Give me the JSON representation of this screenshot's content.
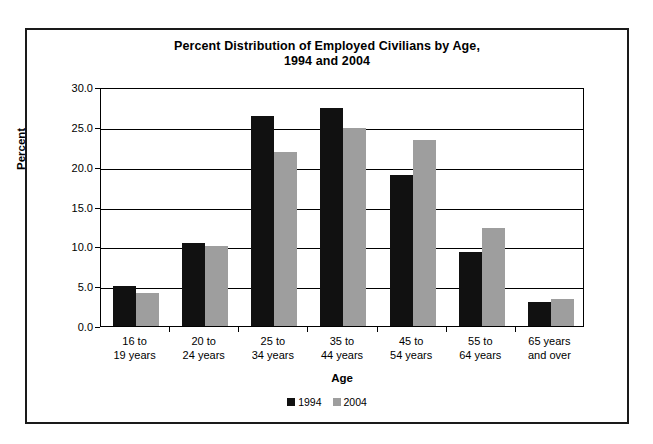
{
  "chart_data": {
    "type": "bar",
    "title": "Percent Distribution of Employed Civilians by Age,",
    "title_line2": "1994 and 2004",
    "xlabel": "Age",
    "ylabel": "Percent",
    "ylim": [
      0,
      30
    ],
    "ytick_labels": [
      "30.0",
      "25.0",
      "20.0",
      "15.0",
      "10.0",
      "5.0",
      "0.0"
    ],
    "ytick_values": [
      30,
      25,
      20,
      15,
      10,
      5,
      0
    ],
    "grid": true,
    "legend_position": "bottom",
    "categories": [
      "16 to\n19 years",
      "20 to\n24 years",
      "25 to\n34 years",
      "35 to\n44 years",
      "45 to\n54 years",
      "55 to\n64 years",
      "65 years\nand over"
    ],
    "categories_lines": [
      [
        "16 to",
        "19 years"
      ],
      [
        "20 to",
        "24 years"
      ],
      [
        "25 to",
        "34 years"
      ],
      [
        "35 to",
        "44 years"
      ],
      [
        "45 to",
        "54 years"
      ],
      [
        "55 to",
        "64 years"
      ],
      [
        "65 years",
        "and over"
      ]
    ],
    "series": [
      {
        "name": "1994",
        "color": "#111111",
        "values": [
          5.0,
          10.4,
          26.3,
          27.4,
          19.0,
          9.3,
          3.0
        ]
      },
      {
        "name": "2004",
        "color": "#9e9e9e",
        "values": [
          4.2,
          10.0,
          21.8,
          24.9,
          23.3,
          12.3,
          3.4
        ]
      }
    ]
  }
}
